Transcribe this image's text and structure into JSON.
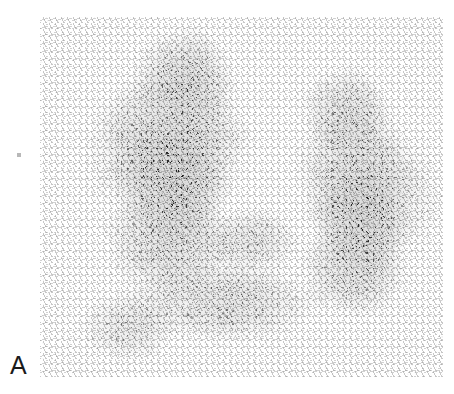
{
  "figure": {
    "panel_label": "A",
    "modality": "thyroid-scintigraphy",
    "caption_text": "",
    "colors": {
      "page_background": "#ffffff",
      "scan_background": "#f4f4f4",
      "counts_ink": "#1a1a1a",
      "label_color": "#1b1b1b",
      "margin_speck": "#b8b8b8"
    },
    "scan_region": {
      "left": 40,
      "top": 17,
      "width": 403,
      "height": 360
    },
    "icons": {
      "margin_speck": "dot-artifact-icon"
    }
  },
  "chart_data": {
    "type": "heatmap",
    "title": "",
    "subtitle": "",
    "xlabel": "",
    "ylabel": "",
    "legend": [],
    "annotations": [
      "A"
    ],
    "grid": false,
    "colormap": "grayscale-inverted",
    "regions": [
      {
        "name": "right-lobe-upper-pole",
        "cx": 0.36,
        "cy": 0.16,
        "rx": 0.11,
        "ry": 0.12,
        "intensity": 0.72
      },
      {
        "name": "right-lobe-mid",
        "cx": 0.34,
        "cy": 0.33,
        "rx": 0.16,
        "ry": 0.19,
        "intensity": 0.88
      },
      {
        "name": "right-lobe-hot-focus",
        "cx": 0.33,
        "cy": 0.46,
        "rx": 0.12,
        "ry": 0.15,
        "intensity": 0.97
      },
      {
        "name": "right-lobe-lower-pole",
        "cx": 0.32,
        "cy": 0.62,
        "rx": 0.14,
        "ry": 0.14,
        "intensity": 0.8
      },
      {
        "name": "isthmus",
        "cx": 0.52,
        "cy": 0.62,
        "rx": 0.12,
        "ry": 0.08,
        "intensity": 0.55
      },
      {
        "name": "left-lobe-upper-pole",
        "cx": 0.76,
        "cy": 0.26,
        "rx": 0.1,
        "ry": 0.11,
        "intensity": 0.7
      },
      {
        "name": "left-lobe-mid",
        "cx": 0.79,
        "cy": 0.44,
        "rx": 0.13,
        "ry": 0.17,
        "intensity": 0.9
      },
      {
        "name": "left-lobe-hot-focus",
        "cx": 0.8,
        "cy": 0.57,
        "rx": 0.11,
        "ry": 0.13,
        "intensity": 0.98
      },
      {
        "name": "left-lobe-lower-pole",
        "cx": 0.78,
        "cy": 0.7,
        "rx": 0.12,
        "ry": 0.12,
        "intensity": 0.74
      },
      {
        "name": "inferior-extension",
        "cx": 0.46,
        "cy": 0.79,
        "rx": 0.22,
        "ry": 0.1,
        "intensity": 0.62
      },
      {
        "name": "lower-left-tail",
        "cx": 0.22,
        "cy": 0.86,
        "rx": 0.11,
        "ry": 0.09,
        "intensity": 0.5
      },
      {
        "name": "scatter-halo-left",
        "cx": 0.21,
        "cy": 0.38,
        "rx": 0.1,
        "ry": 0.16,
        "intensity": 0.26
      },
      {
        "name": "scatter-halo-right",
        "cx": 0.92,
        "cy": 0.5,
        "rx": 0.08,
        "ry": 0.16,
        "intensity": 0.22
      }
    ],
    "intensity_scale": {
      "min": 0,
      "max": 1,
      "min_label": "low counts",
      "max_label": "high counts"
    }
  }
}
